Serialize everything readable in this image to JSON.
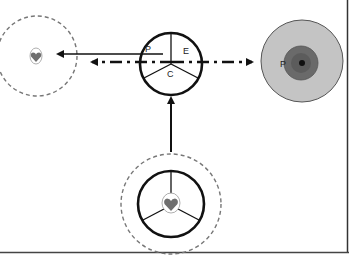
{
  "diagram": {
    "center_wheel": {
      "labels": {
        "p": "P",
        "e": "E",
        "c": "C"
      }
    },
    "right_cell": {
      "label": "P"
    },
    "colors": {
      "stroke": "#111111",
      "dashed_circle": "#777777",
      "heart": "#6e6e6e",
      "right_outer_fill": "#c4c4c4",
      "right_inner_fill": "#6a6a6a",
      "right_core": "#111111"
    }
  }
}
